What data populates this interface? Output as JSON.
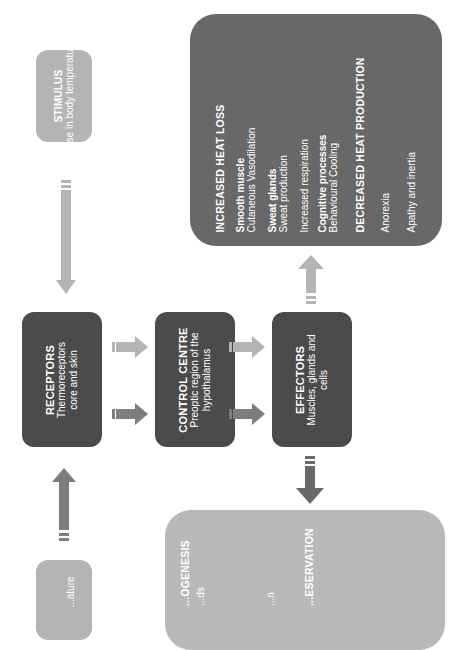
{
  "diagram": {
    "orientation": "rotated-90-counterclockwise",
    "stimulus_top": {
      "title": "STIMULUS",
      "text": "Rise in body temperature"
    },
    "stimulus_bottom": {
      "title": "",
      "text": "...ature"
    },
    "receptors": {
      "title": "RECEPTORS",
      "line1": "Thermoreceptors",
      "line2": "core and skin"
    },
    "control_centre": {
      "title": "CONTROL CENTRE",
      "line1": "Preoptic region of the",
      "line2": "hypothalamus"
    },
    "effectors": {
      "title": "EFFECTORS",
      "line1": "Muscles, glands and",
      "line2": "cells"
    },
    "heat_loss_box": {
      "heading1": "INCREASED HEAT LOSS",
      "items": [
        {
          "bold": "Smooth muscle",
          "text": "Cutaneous Vasodilation"
        },
        {
          "bold": "Sweat glands",
          "text": "Sweat production"
        },
        {
          "bold": "",
          "text": "Increased respiration"
        },
        {
          "bold": "Cognitive processes",
          "text": "Behavioural Cooling"
        }
      ],
      "heading2": "DECREASED HEAT PRODUCTION",
      "items2": [
        "Anorexia",
        "Apathy and inertia"
      ]
    },
    "heat_gain_box": {
      "heading1": "...OGENESIS",
      "line1": "...ds",
      "heading2": "...ESERVATION",
      "line2": "...n"
    },
    "colors": {
      "light": "#b4b4b4",
      "mid": "#7d7d7d",
      "dark": "#4b4b4b",
      "big_dark": "#686868",
      "big_light": "#b9b9b9"
    }
  }
}
